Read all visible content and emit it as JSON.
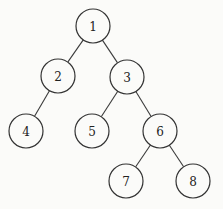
{
  "diagram": {
    "type": "tree",
    "node_radius": 17,
    "nodes": [
      {
        "id": "1",
        "label": "1",
        "x": 93,
        "y": 26
      },
      {
        "id": "2",
        "label": "2",
        "x": 58,
        "y": 76
      },
      {
        "id": "3",
        "label": "3",
        "x": 127,
        "y": 77
      },
      {
        "id": "4",
        "label": "4",
        "x": 26,
        "y": 131
      },
      {
        "id": "5",
        "label": "5",
        "x": 92,
        "y": 131
      },
      {
        "id": "6",
        "label": "6",
        "x": 160,
        "y": 131
      },
      {
        "id": "7",
        "label": "7",
        "x": 126,
        "y": 181
      },
      {
        "id": "8",
        "label": "8",
        "x": 193,
        "y": 181
      }
    ],
    "edges": [
      {
        "from": "1",
        "to": "2"
      },
      {
        "from": "1",
        "to": "3"
      },
      {
        "from": "2",
        "to": "4"
      },
      {
        "from": "3",
        "to": "5"
      },
      {
        "from": "3",
        "to": "6"
      },
      {
        "from": "6",
        "to": "7"
      },
      {
        "from": "6",
        "to": "8"
      }
    ]
  }
}
